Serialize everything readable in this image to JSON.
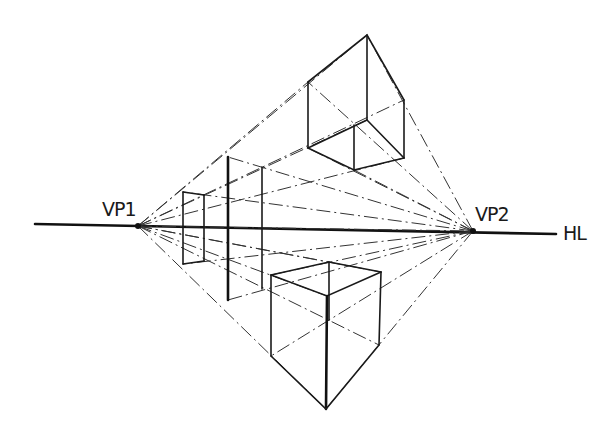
{
  "diagram": {
    "labels": {
      "vp1": "VP1",
      "vp2": "VP2",
      "horizon": "HL"
    },
    "points": {
      "vp1": [
        138,
        226
      ],
      "vp2": [
        473,
        231
      ],
      "horizon_start": [
        35,
        224
      ],
      "horizon_end": [
        556,
        234
      ]
    },
    "objects": [
      {
        "name": "upper-box",
        "position": "above horizon, right"
      },
      {
        "name": "lower-box",
        "position": "below horizon, center"
      },
      {
        "name": "left-planes",
        "position": "straddling horizon near VP1"
      }
    ],
    "colors": {
      "ink": "#1a1a1a",
      "background": "#ffffff"
    }
  }
}
